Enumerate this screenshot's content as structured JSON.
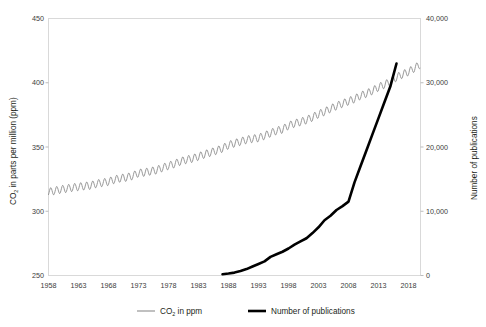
{
  "chart_data": {
    "type": "line",
    "title": "",
    "xlabel": "",
    "xlim": [
      1958,
      2020
    ],
    "grid": false,
    "legend_position": "bottom",
    "x_ticks": [
      "1958",
      "1963",
      "1968",
      "1973",
      "1978",
      "1983",
      "1988",
      "1993",
      "1998",
      "2003",
      "2008",
      "2013",
      "2018"
    ],
    "x_tick_values": [
      1958,
      1963,
      1968,
      1973,
      1978,
      1983,
      1988,
      1993,
      1998,
      2003,
      2008,
      2013,
      2018
    ],
    "axes": [
      {
        "id": "left",
        "label": "CO",
        "label_sub": "2",
        "label_tail": " in parts per million (ppm)",
        "ylim": [
          250,
          450
        ],
        "ticks": [
          "250",
          "300",
          "350",
          "400",
          "450"
        ],
        "tick_values": [
          250,
          300,
          350,
          400,
          450
        ]
      },
      {
        "id": "right",
        "label": "Number of publications",
        "ylim": [
          0,
          40000
        ],
        "ticks": [
          "0",
          "10,000",
          "20,000",
          "30,000",
          "40,000"
        ],
        "tick_values": [
          0,
          10000,
          20000,
          30000,
          40000
        ]
      }
    ],
    "series": [
      {
        "name": "CO",
        "name_sub": "2",
        "name_tail": " in ppm",
        "legend_label": "CO2 in ppm",
        "axis": "left",
        "color": "#8c8c8c",
        "width": 0.9,
        "note": "Keeling curve: monthly CO2 with annual sawtooth oscillation of about 6 ppm peak-to-peak on a rising trend",
        "annual_amplitude": 3.0,
        "x": [
          1958,
          1959,
          1960,
          1961,
          1962,
          1963,
          1964,
          1965,
          1966,
          1967,
          1968,
          1969,
          1970,
          1971,
          1972,
          1973,
          1974,
          1975,
          1976,
          1977,
          1978,
          1979,
          1980,
          1981,
          1982,
          1983,
          1984,
          1985,
          1986,
          1987,
          1988,
          1989,
          1990,
          1991,
          1992,
          1993,
          1994,
          1995,
          1996,
          1997,
          1998,
          1999,
          2000,
          2001,
          2002,
          2003,
          2004,
          2005,
          2006,
          2007,
          2008,
          2009,
          2010,
          2011,
          2012,
          2013,
          2014,
          2015,
          2016,
          2017,
          2018,
          2019
        ],
        "values": [
          315,
          315.9,
          316.9,
          317.6,
          318.4,
          319,
          319.6,
          320,
          321.4,
          322.2,
          323,
          324.6,
          325.7,
          326.3,
          327.5,
          329.7,
          330.2,
          331.1,
          332,
          333.8,
          335.4,
          336.8,
          338.8,
          340.1,
          341,
          342.6,
          344.3,
          345.7,
          347.2,
          348.9,
          351.5,
          352.9,
          354.2,
          355.6,
          356.4,
          357,
          358.8,
          360.8,
          362.6,
          363.7,
          366.6,
          368.3,
          369.5,
          371,
          373.1,
          375.6,
          377.4,
          379.8,
          381.9,
          383.8,
          385.6,
          387.4,
          389.9,
          391.6,
          393.8,
          396.5,
          398.6,
          400.8,
          404.2,
          406.5,
          408.5,
          411.4
        ]
      },
      {
        "name": "Number of publications",
        "legend_label": "Number of publications",
        "axis": "right",
        "color": "#000000",
        "width": 2.6,
        "x": [
          1987,
          1988,
          1989,
          1990,
          1991,
          1992,
          1993,
          1994,
          1995,
          1996,
          1997,
          1998,
          1999,
          2000,
          2001,
          2002,
          2003,
          2004,
          2005,
          2006,
          2007,
          2008,
          2009,
          2010,
          2011,
          2012,
          2013,
          2014,
          2015,
          2016
        ],
        "values": [
          200,
          300,
          450,
          700,
          1000,
          1400,
          1800,
          2200,
          2900,
          3300,
          3700,
          4200,
          4800,
          5300,
          5800,
          6600,
          7500,
          8600,
          9300,
          10200,
          10800,
          11500,
          14500,
          17000,
          19500,
          22000,
          24500,
          27000,
          29500,
          33000
        ]
      }
    ],
    "legend": [
      {
        "label": "CO2 in ppm",
        "color": "#8c8c8c",
        "width": 1.1
      },
      {
        "label": "Number of publications",
        "color": "#000000",
        "width": 2.6
      }
    ]
  }
}
